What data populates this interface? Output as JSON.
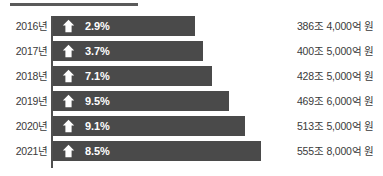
{
  "chart_data": {
    "type": "bar",
    "title": "",
    "subtitle": "",
    "xlabel": "",
    "ylabel": "",
    "orientation": "horizontal",
    "grid": false,
    "legend": null,
    "categories": [
      "2016년",
      "2017년",
      "2018년",
      "2019년",
      "2020년",
      "2021년"
    ],
    "values": [
      2.9,
      3.7,
      7.1,
      9.5,
      9.1,
      8.5
    ],
    "value_labels": [
      "2.9%",
      "3.7%",
      "7.1%",
      "9.5%",
      "9.1%",
      "8.5%"
    ],
    "series": [
      {
        "name": "증가율",
        "values": [
          2.9,
          3.7,
          7.1,
          9.5,
          9.1,
          8.5
        ],
        "labels": [
          "2.9%",
          "3.7%",
          "7.1%",
          "9.5%",
          "9.1%",
          "8.5%"
        ]
      },
      {
        "name": "금액",
        "labels": [
          "386조 4,000억 원",
          "400조 5,000억 원",
          "428조 5,000억 원",
          "469조 6,000억 원",
          "513조 5,000억 원",
          "555조 8,000억 원"
        ]
      }
    ],
    "bar_pixel_lengths": [
      142,
      150,
      159,
      176,
      192,
      208
    ],
    "annotations": [
      "up-arrow on every bar"
    ]
  },
  "rows": [
    {
      "year": "2016년",
      "percent": "2.9%",
      "amount": "386조 4,000억 원",
      "bar_width": "142px",
      "icon": "up-arrow-icon"
    },
    {
      "year": "2017년",
      "percent": "3.7%",
      "amount": "400조 5,000억 원",
      "bar_width": "150px",
      "icon": "up-arrow-icon"
    },
    {
      "year": "2018년",
      "percent": "7.1%",
      "amount": "428조 5,000억 원",
      "bar_width": "159px",
      "icon": "up-arrow-icon"
    },
    {
      "year": "2019년",
      "percent": "9.5%",
      "amount": "469조 6,000억 원",
      "bar_width": "176px",
      "icon": "up-arrow-icon"
    },
    {
      "year": "2020년",
      "percent": "9.1%",
      "amount": "513조 5,000억 원",
      "bar_width": "192px",
      "icon": "up-arrow-icon"
    },
    {
      "year": "2021년",
      "percent": "8.5%",
      "amount": "555조 8,000억 원",
      "bar_width": "208px",
      "icon": "up-arrow-icon"
    }
  ],
  "colors": {
    "bar_fill": "#4a4a4a",
    "axis_line": "#4f4f4f",
    "top_rule": "#5a5a5a",
    "label_text": "#3a3a3a",
    "value_text": "#ffffff",
    "background": "#ffffff"
  }
}
